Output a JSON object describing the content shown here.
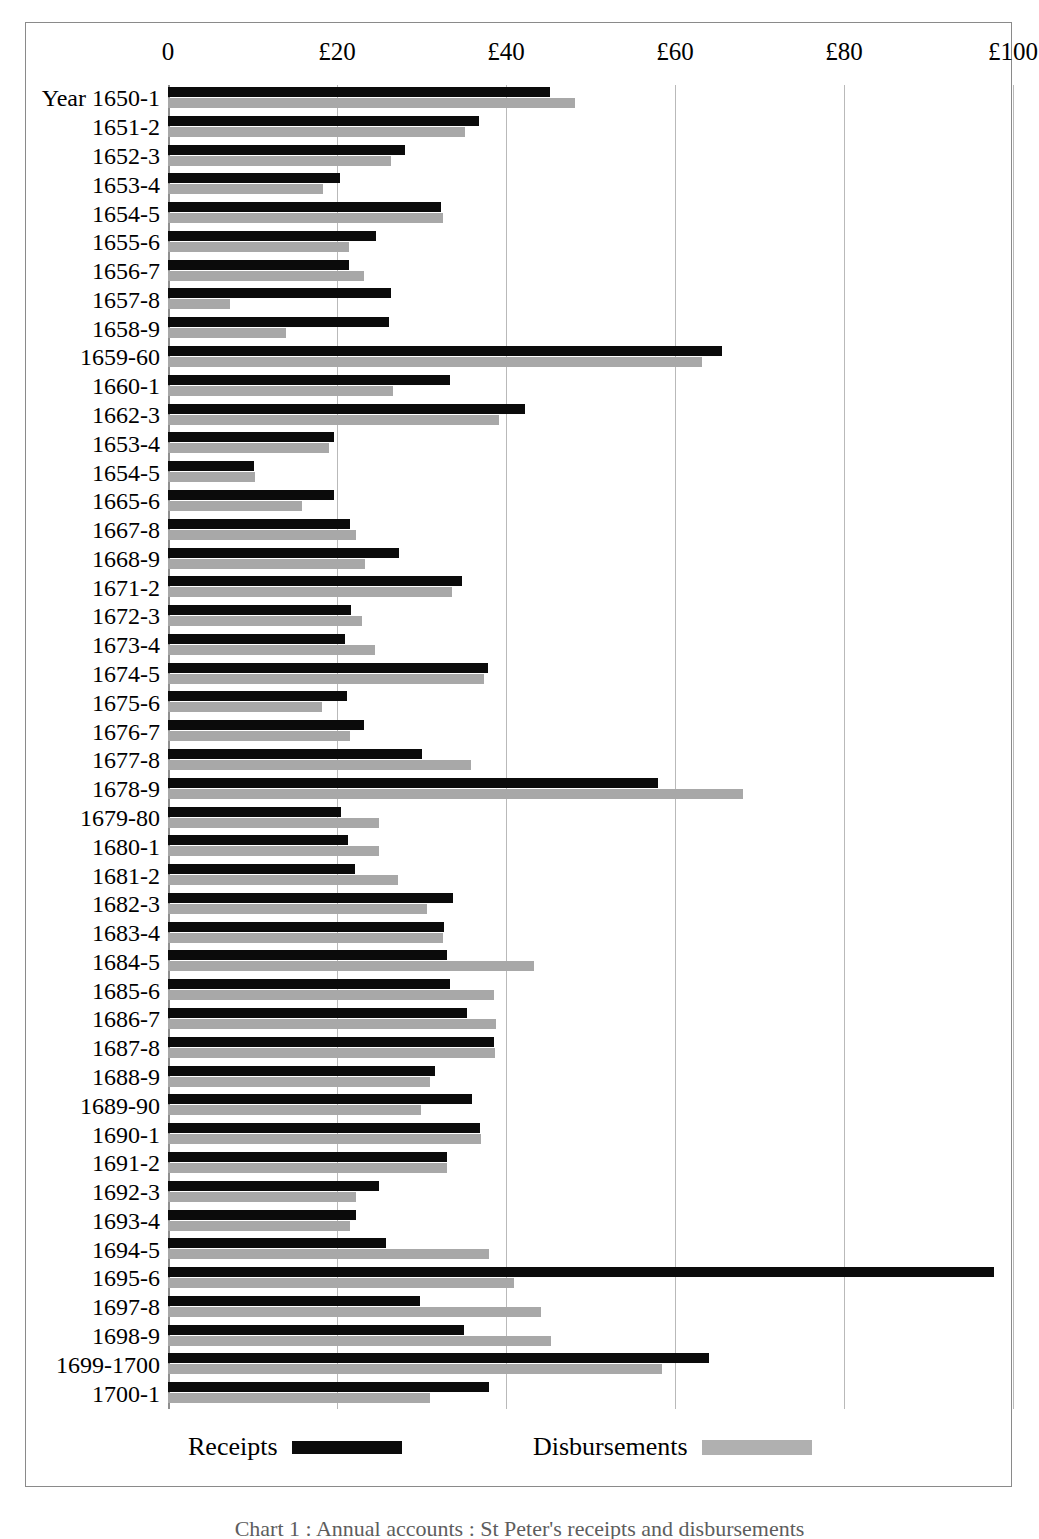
{
  "axis": {
    "tick_labels": [
      "0",
      "£20",
      "£40",
      "£60",
      "£80",
      "£100"
    ],
    "tick_values": [
      0,
      20,
      40,
      60,
      80,
      100
    ]
  },
  "legend": {
    "receipts_label": "Receipts",
    "disbursements_label": "Disbursements"
  },
  "colors": {
    "receipts": "#0b0b0b",
    "disbursements": "#a8a8a8",
    "gridline": "#b9b9b9",
    "frame": "#8a8a8a"
  },
  "caption": {
    "text": "Chart 1 : Annual accounts : St Peter's receipts and disbursements"
  },
  "chart_data": {
    "type": "bar",
    "orientation": "horizontal",
    "title": "",
    "xlabel": "",
    "ylabel": "",
    "xlim": [
      0,
      100
    ],
    "grid": true,
    "legend_position": "bottom",
    "categories": [
      "Year 1650-1",
      "1651-2",
      "1652-3",
      "1653-4",
      "1654-5",
      "1655-6",
      "1656-7",
      "1657-8",
      "1658-9",
      "1659-60",
      "1660-1",
      "1662-3",
      "1653-4",
      "1654-5",
      "1665-6",
      "1667-8",
      "1668-9",
      "1671-2",
      "1672-3",
      "1673-4",
      "1674-5",
      "1675-6",
      "1676-7",
      "1677-8",
      "1678-9",
      "1679-80",
      "1680-1",
      "1681-2",
      "1682-3",
      "1683-4",
      "1684-5",
      "1685-6",
      "1686-7",
      "1687-8",
      "1688-9",
      "1689-90",
      "1690-1",
      "1691-2",
      "1692-3",
      "1693-4",
      "1694-5",
      "1695-6",
      "1697-8",
      "1698-9",
      "1699-1700",
      "1700-1"
    ],
    "series": [
      {
        "name": "Receipts",
        "color": "#0b0b0b",
        "values": [
          45.2,
          36.8,
          28.0,
          20.4,
          32.3,
          24.6,
          21.4,
          26.4,
          26.1,
          65.6,
          33.4,
          42.2,
          19.7,
          10.2,
          19.6,
          21.5,
          27.3,
          34.8,
          21.6,
          21.0,
          37.9,
          21.2,
          23.2,
          30.1,
          58.0,
          20.5,
          21.3,
          22.1,
          33.7,
          32.7,
          33.0,
          33.4,
          35.4,
          38.6,
          31.6,
          36.0,
          36.9,
          33.0,
          25.0,
          22.3,
          25.8,
          97.8,
          29.8,
          35.0,
          64.0,
          38.0
        ]
      },
      {
        "name": "Disbursements",
        "color": "#a8a8a8",
        "values": [
          48.2,
          35.1,
          26.4,
          18.4,
          32.6,
          21.4,
          23.2,
          7.3,
          14.0,
          63.2,
          26.6,
          39.2,
          19.0,
          10.3,
          15.8,
          22.3,
          23.3,
          33.6,
          23.0,
          24.5,
          37.4,
          18.2,
          21.5,
          35.8,
          68.0,
          25.0,
          25.0,
          27.2,
          30.6,
          32.5,
          43.3,
          38.6,
          38.8,
          38.7,
          31.0,
          29.9,
          37.0,
          33.0,
          22.2,
          21.5,
          38.0,
          41.0,
          44.2,
          45.3,
          58.5,
          31.0
        ]
      }
    ]
  }
}
